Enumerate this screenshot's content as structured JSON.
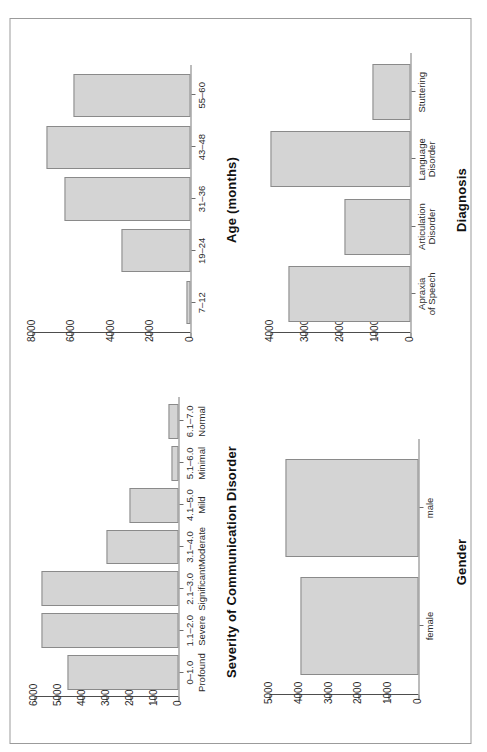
{
  "figure": {
    "background": "#ffffff",
    "frame_color": "#9b9b9b",
    "bar_fill": "#d4d4d4",
    "bar_stroke": "#8a8a8a",
    "axis_color": "#4d4d4d",
    "orientation_note": "rotated-90-ccw"
  },
  "chart_data": [
    {
      "type": "bar",
      "id": "severity",
      "title": "Severity of Communication Disorder",
      "xlabel": "Severity of Communication Disorder",
      "ylabel": "",
      "categories": [
        "0–1.0",
        "1.1–2.0",
        "2.1–3.0",
        "3.1–4.0",
        "4.1–5.0",
        "5.1–6.0",
        "6.1–7.0"
      ],
      "category_sublabels": [
        "Profound",
        "Severe",
        "Significant",
        "Moderate",
        "Mild",
        "Minimal",
        "Normal"
      ],
      "values": [
        4600,
        5700,
        5700,
        3000,
        2050,
        300,
        420
      ],
      "yticks": [
        0,
        1000,
        2000,
        3000,
        4000,
        5000,
        6000
      ],
      "ytick_labels": [
        "0",
        "1000",
        "2000",
        "3000",
        "4000",
        "5000",
        "6000"
      ],
      "ylim": [
        0,
        6400
      ],
      "grid": false,
      "legend": "none"
    },
    {
      "type": "bar",
      "id": "age",
      "title": "Age (months)",
      "xlabel": "Age (months)",
      "ylabel": "",
      "categories": [
        "7–12",
        "19–24",
        "31–36",
        "43–48",
        "55–60"
      ],
      "category_sublabels": [
        "",
        "",
        "",
        "",
        ""
      ],
      "values": [
        200,
        3500,
        6400,
        7300,
        5900
      ],
      "yticks": [
        0,
        2000,
        4000,
        6000,
        8000
      ],
      "ytick_labels": [
        "0",
        "2000",
        "4000",
        "6000",
        "8000"
      ],
      "ylim": [
        0,
        8400
      ],
      "grid": false,
      "legend": "none"
    },
    {
      "type": "bar",
      "id": "gender",
      "title": "Gender",
      "xlabel": "Gender",
      "ylabel": "",
      "categories": [
        "female",
        "male"
      ],
      "category_sublabels": [
        "",
        ""
      ],
      "values": [
        3950,
        4450
      ],
      "yticks": [
        0,
        1000,
        2000,
        3000,
        4000,
        5000
      ],
      "ytick_labels": [
        "0",
        "1000",
        "2000",
        "3000",
        "4000",
        "5000"
      ],
      "ylim": [
        0,
        5300
      ],
      "grid": false,
      "legend": "none"
    },
    {
      "type": "bar",
      "id": "diagnosis",
      "title": "Diagnosis",
      "xlabel": "Diagnosis",
      "ylabel": "",
      "categories": [
        "Apraxia\nof Speech",
        "Articulation\nDisorder",
        "Language\nDisorder",
        "Stuttering"
      ],
      "category_sublabels": [
        "",
        "",
        "",
        ""
      ],
      "values": [
        3500,
        1900,
        4000,
        1100
      ],
      "yticks": [
        0,
        1000,
        2000,
        3000,
        4000
      ],
      "ytick_labels": [
        "0",
        "1000",
        "2000",
        "3000",
        "4000"
      ],
      "ylim": [
        0,
        4300
      ],
      "grid": false,
      "legend": "none"
    }
  ]
}
